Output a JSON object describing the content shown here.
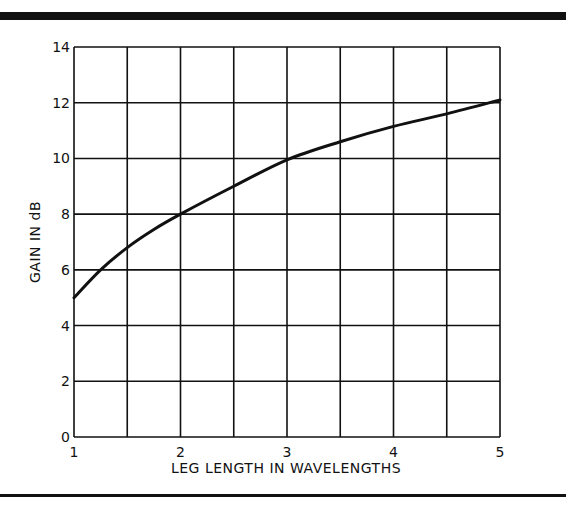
{
  "chart_data": {
    "type": "line",
    "title": "",
    "xlabel": "LEG LENGTH IN WAVELENGTHS",
    "ylabel": "GAIN IN dB",
    "xlim": [
      1,
      5
    ],
    "ylim": [
      0,
      14
    ],
    "x_ticks": [
      "1",
      "2",
      "3",
      "4",
      "5"
    ],
    "y_ticks": [
      "0",
      "2",
      "4",
      "6",
      "8",
      "10",
      "12",
      "14"
    ],
    "grid": true,
    "grid_x_step": 0.5,
    "grid_y_step": 2,
    "legend": null,
    "series": [
      {
        "name": "Gain",
        "x": [
          1.0,
          1.25,
          1.5,
          1.75,
          2.0,
          2.5,
          3.0,
          3.5,
          4.0,
          4.5,
          5.0
        ],
        "values": [
          5.0,
          6.0,
          6.8,
          7.45,
          8.0,
          9.0,
          9.95,
          10.6,
          11.15,
          11.6,
          12.1
        ]
      }
    ]
  },
  "colors": {
    "ink": "#111111",
    "background": "#ffffff"
  }
}
